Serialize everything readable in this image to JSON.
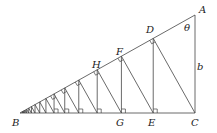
{
  "diagram": {
    "type": "geometry-figure",
    "labels": {
      "A": "A",
      "B": "B",
      "C": "C",
      "D": "D",
      "E": "E",
      "F": "F",
      "G": "G",
      "H": "H",
      "theta": "θ",
      "b": "b"
    },
    "vertices": {
      "A": [
        195,
        15
      ],
      "B": [
        20,
        113
      ],
      "C": [
        195,
        113
      ]
    },
    "ratio": 0.761,
    "steps": 16,
    "colors": {
      "line": "#444444",
      "text": "#222222"
    }
  }
}
